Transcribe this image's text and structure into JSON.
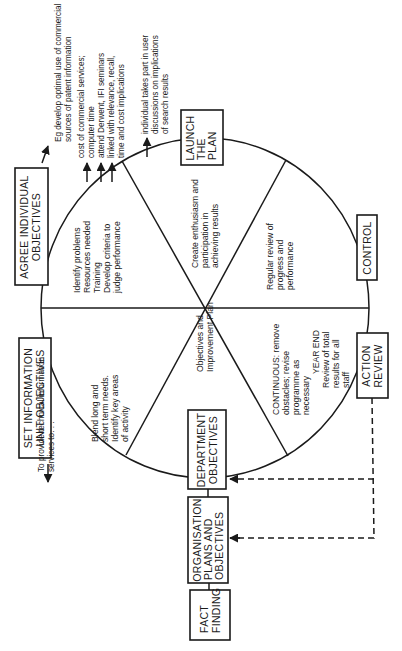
{
  "diagram": {
    "orientation": "rotated 90° counter-clockwise",
    "cycle_stages": [
      {
        "id": "set-information-unit-objectives",
        "lines": [
          "SET INFORMATION",
          "UNIT OBJECTIVES"
        ]
      },
      {
        "id": "agree-individual-objectives",
        "lines": [
          "AGREE INDIVIDUAL",
          "OBJECTIVES"
        ]
      },
      {
        "id": "launch-the-plan",
        "lines": [
          "LAUNCH",
          "THE",
          "PLAN"
        ]
      },
      {
        "id": "control",
        "lines": [
          "CONTROL"
        ]
      },
      {
        "id": "action-review",
        "lines": [
          "ACTION",
          "REVIEW"
        ]
      },
      {
        "id": "department-objectives",
        "lines": [
          "DEPARTMENT",
          "OBJECTIVES"
        ]
      }
    ],
    "input_chain": [
      {
        "id": "fact-finding",
        "lines": [
          "FACT",
          "FINDING"
        ]
      },
      {
        "id": "organisation-plans",
        "lines": [
          "ORGANISATION",
          "PLANS AND",
          "OBJECTIVES"
        ]
      }
    ],
    "segments": {
      "blend": [
        "Blend long and",
        "short term needs.",
        "Identify key areas",
        "of activity"
      ],
      "identify": [
        "Identify problems",
        "Resources needed",
        "Training",
        "Develop criteria to",
        "judge performance"
      ],
      "enthusiasm": [
        "Create enthusiasm and",
        "participation in",
        "achieving results"
      ],
      "regular_review": [
        "Regular review of",
        "progress and",
        "performance"
      ],
      "continuous": [
        "CONTINUOUS: remove",
        "obstacles; revise",
        "programme as",
        "necessary"
      ],
      "year_end": [
        "YEAR END",
        "Review of total",
        "results for all",
        "staff"
      ],
      "objectives_plan": [
        "Objectives and",
        "Improvement Plan"
      ]
    },
    "annotations": {
      "provide": [
        "To provide technical information",
        "services to. . ."
      ],
      "eg_develop": [
        "Eg develop optimal use of commercial",
        "sources of patent information"
      ],
      "cost": [
        "cost of commercial services;",
        "computer time"
      ],
      "attend": [
        "attend Derwent, IFI seminars",
        "linked with relevance, recall,",
        "time and cost implications"
      ],
      "individual": [
        "individual takes part in user",
        "discussions on implications",
        "of search results"
      ]
    }
  }
}
